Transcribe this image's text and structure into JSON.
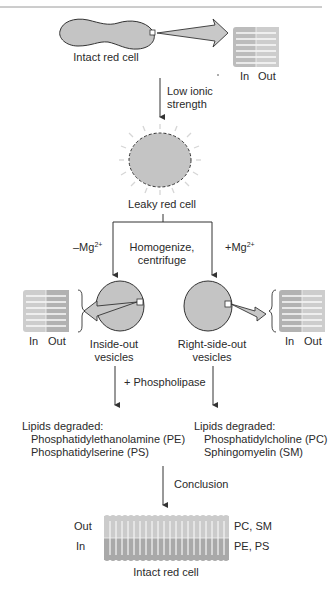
{
  "top": {
    "intact_cell_label": "Intact red cell",
    "bilayer_in": "In",
    "bilayer_out": "Out",
    "step_label_1": "Low ionic",
    "step_label_2": "strength"
  },
  "leaky": {
    "label": "Leaky red cell"
  },
  "branch": {
    "left_condition_prefix": "–Mg",
    "left_condition_sup": "2+",
    "right_condition_prefix": "+Mg",
    "right_condition_sup": "2+",
    "center_line_1": "Homogenize,",
    "center_line_2": "centrifuge"
  },
  "vesicles": {
    "left": {
      "label_1": "Inside-out",
      "label_2": "vesicles",
      "bilayer_in": "In",
      "bilayer_out": "Out"
    },
    "right": {
      "label_1": "Right-side-out",
      "label_2": "vesicles",
      "bilayer_in": "In",
      "bilayer_out": "Out"
    }
  },
  "treatment": {
    "label": "+ Phospholipase"
  },
  "results": {
    "left": {
      "heading": "Lipids degraded:",
      "items": [
        "Phosphatidylethanolamine (PE)",
        "Phosphatidylserine (PS)"
      ]
    },
    "right": {
      "heading": "Lipids degraded:",
      "items": [
        "Phosphatidylcholine (PC)",
        "Sphingomyelin (SM)"
      ]
    }
  },
  "conclusion": {
    "arrow_label": "Conclusion",
    "out_label": "Out",
    "in_label": "In",
    "out_lipids": "PC, SM",
    "in_lipids": "PE, PS",
    "caption": "Intact red cell"
  },
  "colors": {
    "cell_fill": "#c4c4c4",
    "outer_leaflet": "#c8c8c8",
    "inner_leaflet": "#a9a9a9",
    "stroke": "#333333"
  }
}
